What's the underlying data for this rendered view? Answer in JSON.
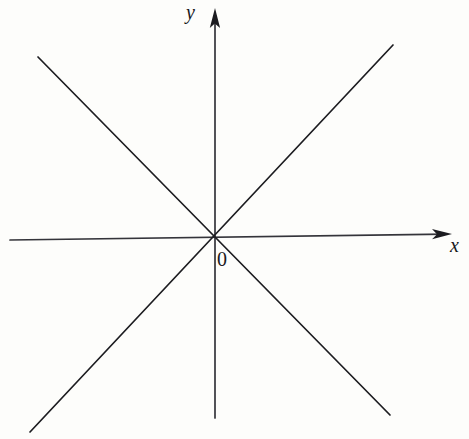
{
  "figure": {
    "title": "",
    "background_color": "#fdfdfb",
    "stroke_color": "#1c1c20",
    "width": 469,
    "height": 439
  },
  "labels": {
    "y_axis": "y",
    "x_axis": "x",
    "origin": "0"
  },
  "icons": {
    "y_arrowhead": "arrow-up-icon",
    "x_arrowhead": "arrow-right-icon"
  },
  "chart_data": {
    "type": "line",
    "title": "",
    "xlabel": "x",
    "ylabel": "y",
    "grid": false,
    "legend": "none",
    "origin_label": "0",
    "origin_px": [
      215,
      238
    ],
    "axes": [
      {
        "name": "x-axis",
        "label": "x",
        "arrow": "right",
        "start_px": [
          10,
          240
        ],
        "end_px": [
          452,
          234
        ],
        "label_px": [
          457,
          247
        ]
      },
      {
        "name": "y-axis",
        "label": "y",
        "arrow": "up",
        "start_px": [
          215,
          418
        ],
        "end_px": [
          215,
          8
        ],
        "label_px": [
          193,
          13
        ]
      }
    ],
    "series": [
      {
        "name": "line-positive-slope",
        "equation": "y = x",
        "slope": 1.07,
        "intercept": 0,
        "values": [
          [
            -185,
            -194
          ],
          [
            178,
            193
          ]
        ],
        "start_px": [
          30,
          432
        ],
        "end_px": [
          393,
          45
        ]
      },
      {
        "name": "line-negative-slope",
        "equation": "y = -x",
        "slope": -1.02,
        "intercept": 0,
        "values": [
          [
            -177,
            181
          ],
          [
            175,
            -177
          ]
        ],
        "start_px": [
          38,
          57
        ],
        "end_px": [
          390,
          415
        ]
      }
    ],
    "xlim": [
      -205,
      237
    ],
    "ylim": [
      -180,
      230
    ]
  }
}
